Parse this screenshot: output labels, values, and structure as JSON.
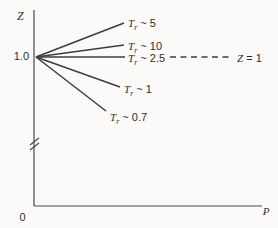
{
  "figure": {
    "background": "#fbfaf8",
    "line_color": "#3d3d3d",
    "axis_color": "#4a4a4a",
    "text_color": "#2e2e2e"
  },
  "axes": {
    "y_label": "Z",
    "x_label": "P",
    "y_tick": "1.0",
    "origin_tick": "0"
  },
  "annotation": {
    "symbol": "Z",
    "rest": " = 1"
  },
  "chart_data": {
    "type": "line",
    "title": "",
    "xlabel": "P",
    "ylabel": "Z",
    "x_origin_label": "0",
    "y_tick_labels": [
      "1.0"
    ],
    "axis_break_on_y": true,
    "note": "Qualitative sketch: compressibility factor Z versus pressure P; isotherms at constant reduced temperature Tr all emanate from Z = 1.0 at P = 0",
    "common_point": {
      "P": 0,
      "Z": 1.0
    },
    "series": [
      {
        "name": "Tr ~ 5",
        "symbol": "T",
        "subscript": "r",
        "relation": "~",
        "value": "5",
        "trend": "increasing"
      },
      {
        "name": "Tr ~ 10",
        "symbol": "T",
        "subscript": "r",
        "relation": "~",
        "value": "10",
        "trend": "increasing"
      },
      {
        "name": "Tr ~ 2.5",
        "symbol": "T",
        "subscript": "r",
        "relation": "~",
        "value": "2.5",
        "trend": "flat"
      },
      {
        "name": "Tr ~ 1",
        "symbol": "T",
        "subscript": "r",
        "relation": "~",
        "value": "1",
        "trend": "decreasing"
      },
      {
        "name": "Tr ~ 0.7",
        "symbol": "T",
        "subscript": "r",
        "relation": "~",
        "value": "0.7",
        "trend": "decreasing"
      }
    ],
    "reference_line": {
      "style": "dashed",
      "label": "Z = 1",
      "z": 1.0
    },
    "geometry_px": {
      "canvas": {
        "w": 278,
        "h": 228
      },
      "y_axis": {
        "x": 34,
        "y1": 10,
        "y2": 206
      },
      "x_axis": {
        "y": 206,
        "x1": 34,
        "x2": 262
      },
      "fan_origin": {
        "x": 36,
        "y": 57
      },
      "series_ends": [
        [
          124,
          23
        ],
        [
          124,
          45
        ],
        [
          125,
          57
        ],
        [
          120,
          87
        ],
        [
          106,
          111
        ]
      ],
      "series_label_pos": [
        [
          128,
          23
        ],
        [
          128,
          46
        ],
        [
          128,
          58
        ],
        [
          124,
          89
        ],
        [
          110,
          117
        ]
      ],
      "dashed": {
        "x1": 170,
        "x2": 233,
        "y": 57
      },
      "break_marks": [
        [
          30,
          150,
          39,
          143
        ],
        [
          30,
          145,
          39,
          138
        ]
      ]
    }
  }
}
